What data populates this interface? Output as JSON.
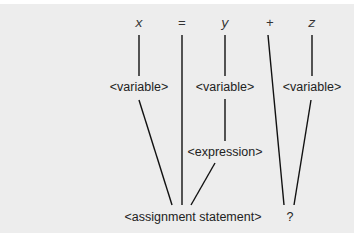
{
  "diagram": {
    "type": "parse-tree",
    "background": "#ededed",
    "tokens": [
      {
        "id": "tok-x",
        "label": "x",
        "x": 139,
        "y": 27
      },
      {
        "id": "tok-eq",
        "label": "=",
        "x": 182,
        "y": 27
      },
      {
        "id": "tok-y",
        "label": "y",
        "x": 225,
        "y": 27
      },
      {
        "id": "tok-plus",
        "label": "+",
        "x": 270,
        "y": 27
      },
      {
        "id": "tok-z",
        "label": "z",
        "x": 312,
        "y": 27
      }
    ],
    "nodes": [
      {
        "id": "var-x",
        "label": "<variable>",
        "x": 139,
        "y": 91
      },
      {
        "id": "var-y",
        "label": "<variable>",
        "x": 225,
        "y": 91
      },
      {
        "id": "var-z",
        "label": "<variable>",
        "x": 312,
        "y": 91
      },
      {
        "id": "expr",
        "label": "<expression>",
        "x": 225,
        "y": 156
      },
      {
        "id": "assign",
        "label": "<assignment statement>",
        "x": 193,
        "y": 221
      },
      {
        "id": "unknown",
        "label": "?",
        "x": 290,
        "y": 221
      }
    ],
    "edges": [
      {
        "from": "tok-x",
        "to": "var-x",
        "x1": 139,
        "y1": 35,
        "x2": 139,
        "y2": 76
      },
      {
        "from": "tok-y",
        "to": "var-y",
        "x1": 225,
        "y1": 35,
        "x2": 225,
        "y2": 76
      },
      {
        "from": "tok-z",
        "to": "var-z",
        "x1": 312,
        "y1": 35,
        "x2": 312,
        "y2": 76
      },
      {
        "from": "var-y",
        "to": "expr",
        "x1": 225,
        "y1": 99,
        "x2": 225,
        "y2": 141
      },
      {
        "from": "var-x",
        "to": "assign",
        "x1": 139,
        "y1": 100,
        "x2": 172,
        "y2": 205
      },
      {
        "from": "tok-eq",
        "to": "assign",
        "x1": 182,
        "y1": 35,
        "x2": 182,
        "y2": 205
      },
      {
        "from": "expr",
        "to": "assign",
        "x1": 215,
        "y1": 163,
        "x2": 191,
        "y2": 205
      },
      {
        "from": "tok-plus",
        "to": "unknown",
        "x1": 268,
        "y1": 35,
        "x2": 284,
        "y2": 205
      },
      {
        "from": "var-z",
        "to": "unknown",
        "x1": 311,
        "y1": 100,
        "x2": 294,
        "y2": 205
      }
    ]
  }
}
